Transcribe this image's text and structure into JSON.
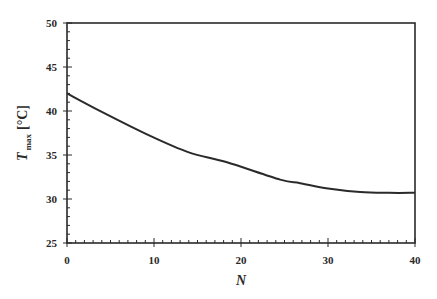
{
  "chart_data": {
    "type": "line",
    "title": "",
    "xlabel": "N",
    "ylabel": {
      "main": "T",
      "subscript": "max",
      "unit": "[°C]"
    },
    "xlim": [
      0,
      40
    ],
    "ylim": [
      25,
      50
    ],
    "xticks": [
      0,
      10,
      20,
      30,
      40
    ],
    "yticks": [
      25,
      30,
      35,
      40,
      45,
      50
    ],
    "x_minor_step": 1,
    "y_minor_step": 1,
    "grid": false,
    "legend": null,
    "series": [
      {
        "name": "T_max",
        "color": "#2a2a2a",
        "x": [
          0,
          4,
          9.5,
          14,
          18.3,
          24.5,
          26.8,
          30,
          33.7,
          37,
          40
        ],
        "y": [
          42.0,
          39.9,
          37.2,
          35.3,
          34.2,
          32.2,
          31.8,
          31.2,
          30.8,
          30.7,
          30.7
        ]
      }
    ]
  }
}
